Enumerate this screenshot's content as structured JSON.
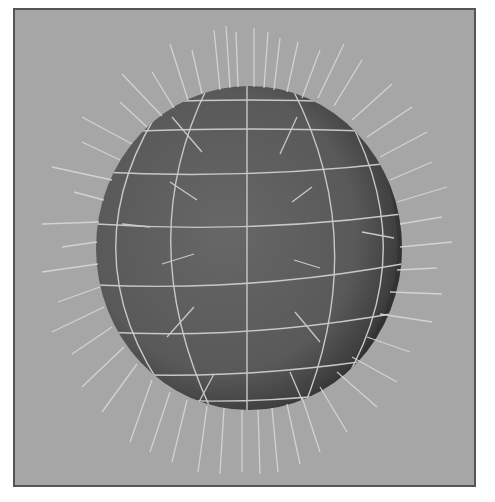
{
  "scene": {
    "type": "3d-viewport-render",
    "subject": "wireframe sphere with surface normals",
    "colors": {
      "page_background": "#ffffff",
      "viewport_background": "#a6a6a6",
      "viewport_border": "#555555",
      "sphere_fill": "#5e5e5e",
      "sphere_shadow": "#2e2e2e",
      "wire_color": "#c8c8c8",
      "normal_color": "#d6d6d6"
    },
    "sphere": {
      "cx": 247,
      "cy": 246,
      "rx": 153,
      "ry": 162
    },
    "meridians": 5,
    "parallels": 7
  }
}
